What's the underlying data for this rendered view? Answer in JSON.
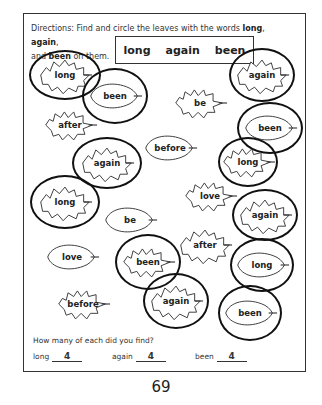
{
  "directions": {
    "prefix": "Directions: Find and circle the leaves with the words ",
    "w1": "long",
    "sep1": ", ",
    "w2": "again",
    "sep2": ",",
    "line2_prefix": "and ",
    "w3": "been",
    "suffix": " on them."
  },
  "word_box": [
    "long",
    "again",
    "been"
  ],
  "leaves": [
    {
      "word": "long",
      "x": 65,
      "y": 75,
      "circled": true,
      "ow": 72,
      "oh": 50
    },
    {
      "word": "been",
      "x": 115,
      "y": 96,
      "circled": true,
      "ow": 66,
      "oh": 56
    },
    {
      "word": "after",
      "x": 70,
      "y": 125,
      "circled": false
    },
    {
      "word": "again",
      "x": 107,
      "y": 163,
      "circled": true,
      "ow": 70,
      "oh": 52
    },
    {
      "word": "before",
      "x": 170,
      "y": 148,
      "circled": false
    },
    {
      "word": "be",
      "x": 200,
      "y": 103,
      "circled": false
    },
    {
      "word": "again",
      "x": 262,
      "y": 75,
      "circled": true,
      "ow": 66,
      "oh": 54
    },
    {
      "word": "been",
      "x": 270,
      "y": 128,
      "circled": true,
      "ow": 66,
      "oh": 52
    },
    {
      "word": "long",
      "x": 248,
      "y": 162,
      "circled": true,
      "ow": 60,
      "oh": 50
    },
    {
      "word": "long",
      "x": 65,
      "y": 202,
      "circled": true,
      "ow": 70,
      "oh": 54
    },
    {
      "word": "be",
      "x": 130,
      "y": 220,
      "circled": false
    },
    {
      "word": "love",
      "x": 210,
      "y": 196,
      "circled": false
    },
    {
      "word": "again",
      "x": 265,
      "y": 215,
      "circled": true,
      "ow": 66,
      "oh": 52
    },
    {
      "word": "love",
      "x": 72,
      "y": 257,
      "circled": false
    },
    {
      "word": "been",
      "x": 148,
      "y": 262,
      "circled": true,
      "ow": 66,
      "oh": 56
    },
    {
      "word": "after",
      "x": 205,
      "y": 245,
      "circled": false
    },
    {
      "word": "long",
      "x": 262,
      "y": 265,
      "circled": true,
      "ow": 64,
      "oh": 54
    },
    {
      "word": "before",
      "x": 83,
      "y": 304,
      "circled": false
    },
    {
      "word": "again",
      "x": 176,
      "y": 301,
      "circled": true,
      "ow": 66,
      "oh": 56
    },
    {
      "word": "been",
      "x": 250,
      "y": 313,
      "circled": true,
      "ow": 64,
      "oh": 56
    }
  ],
  "question": "How many of each did you find?",
  "answers": [
    {
      "label": "long",
      "value": "4"
    },
    {
      "label": "again",
      "value": "4"
    },
    {
      "label": "been",
      "value": "4"
    }
  ],
  "page_number": "69"
}
